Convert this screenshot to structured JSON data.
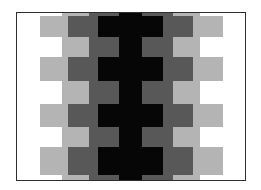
{
  "figure": {
    "title": "",
    "colors": {
      "background": "#ffffff",
      "light_gray": "#b4b4b4",
      "dark_gray": "#585858",
      "black": "#060606",
      "frame": "#2e2e2e"
    },
    "pattern": {
      "row_types": [
        "B",
        "A",
        "B",
        "A",
        "B",
        "A",
        "B",
        "A",
        "B"
      ],
      "row_A_columns": [
        "white",
        "light_gray",
        "dark_gray",
        "black",
        "dark_gray",
        "light_gray",
        "white"
      ],
      "row_B_columns": [
        "white",
        "light_gray",
        "dark_gray",
        "black",
        "dark_gray",
        "light_gray",
        "white"
      ]
    }
  }
}
